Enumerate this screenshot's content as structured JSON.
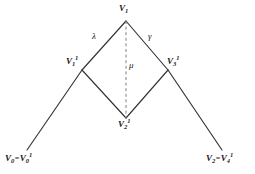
{
  "figure": {
    "kind": "vertex-diagram",
    "background_color": "#ffffff",
    "stroke_color": "#333333",
    "dashed_stroke_color": "#777777",
    "text_color": "#1a1a1a"
  },
  "vertices": {
    "v1": {
      "base": "V",
      "sub": "1",
      "sup": "",
      "x": 126,
      "y": 19
    },
    "v1_1": {
      "base": "V",
      "sub": "1",
      "sup": "1",
      "x": 82,
      "y": 70
    },
    "v2_1": {
      "base": "V",
      "sub": "2",
      "sup": "1",
      "x": 126,
      "y": 118
    },
    "v3_1": {
      "base": "V",
      "sub": "3",
      "sup": "1",
      "x": 168,
      "y": 70
    },
    "v0": {
      "base": "V",
      "sub": "0",
      "sup": "",
      "x": 27,
      "y": 150
    },
    "v0_1": {
      "base": "V",
      "sub": "0",
      "sup": "1"
    },
    "v2": {
      "base": "V",
      "sub": "2",
      "sup": "",
      "x": 222,
      "y": 150
    },
    "v4_1": {
      "base": "V",
      "sub": "4",
      "sup": "1"
    }
  },
  "labels": {
    "top_vertex": "V1",
    "left_inner_vertex": "V1^1",
    "bottom_vertex": "V2^1",
    "right_inner_vertex": "V3^1",
    "bottom_left_equality": "V0 = V0^1",
    "bottom_right_equality": "V2 = V4^1",
    "equals_sign": "="
  },
  "edge_labels": {
    "lambda": "λ",
    "mu": "μ",
    "gamma": "γ"
  },
  "edges": [
    {
      "name": "v1-to-v1_1",
      "from": "v1",
      "to": "v1_1",
      "style": "solid",
      "label": "λ"
    },
    {
      "name": "v1-to-v3_1",
      "from": "v1",
      "to": "v3_1",
      "style": "solid",
      "label": "γ"
    },
    {
      "name": "v1_1-to-v2_1",
      "from": "v1_1",
      "to": "v2_1",
      "style": "solid",
      "label": ""
    },
    {
      "name": "v3_1-to-v2_1",
      "from": "v3_1",
      "to": "v2_1",
      "style": "solid",
      "label": ""
    },
    {
      "name": "v1-to-v2_1-dashed",
      "from": "v1",
      "to": "v2_1",
      "style": "dashed",
      "label": "μ"
    },
    {
      "name": "v1_1-to-v0",
      "from": "v1_1",
      "to": "v0",
      "style": "solid",
      "label": ""
    },
    {
      "name": "v3_1-to-v2",
      "from": "v3_1",
      "to": "v2",
      "style": "solid",
      "label": ""
    }
  ]
}
